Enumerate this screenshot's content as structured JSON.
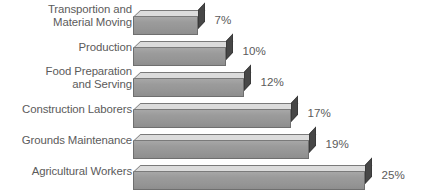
{
  "chart_data": {
    "type": "bar",
    "orientation": "horizontal",
    "style": "3d",
    "title": "",
    "subtitle": "",
    "xlabel": "",
    "ylabel": "",
    "grid": false,
    "legend": false,
    "value_suffix": "%",
    "xlim": [
      0,
      25
    ],
    "categories": [
      "Transportion and\nMaterial Moving",
      "Production",
      "Food Preparation\nand Serving",
      "Construction Laborers",
      "Grounds Maintenance",
      "Agricultural Workers"
    ],
    "values": [
      7,
      10,
      12,
      17,
      19,
      25
    ],
    "value_labels": [
      "7%",
      "10%",
      "12%",
      "17%",
      "19%",
      "25%"
    ]
  },
  "colors": {
    "background": "#ffffff",
    "bar_front": "#9a9a9a",
    "bar_top": "#dcdcdc",
    "bar_side": "#474747",
    "bar_outline": "#6f6f6f",
    "text": "#5b5b5b"
  },
  "rows": [
    {
      "label": "Transportion and\nMaterial Moving",
      "value_label": "7%",
      "lines": 2
    },
    {
      "label": "Production",
      "value_label": "10%",
      "lines": 1
    },
    {
      "label": "Food Preparation\nand Serving",
      "value_label": "12%",
      "lines": 2
    },
    {
      "label": "Construction Laborers",
      "value_label": "17%",
      "lines": 1
    },
    {
      "label": "Grounds Maintenance",
      "value_label": "19%",
      "lines": 1
    },
    {
      "label": "Agricultural Workers",
      "value_label": "25%",
      "lines": 1
    }
  ]
}
